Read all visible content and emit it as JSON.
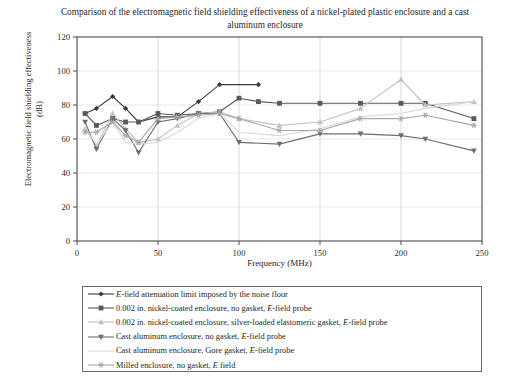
{
  "chart_data": {
    "type": "line",
    "title": "Comparison of the electromagnetic field shielding effectiveness of a nickel-plated plastic enclosure and a cast aluminum enclosure",
    "xlabel": "Frequency (MHz)",
    "ylabel": "Electromagnetic field shielding effectiveness (dB)",
    "xlim": [
      0,
      250
    ],
    "ylim": [
      0,
      120
    ],
    "xticks": [
      0,
      50,
      100,
      150,
      200,
      250
    ],
    "yticks": [
      0,
      20,
      40,
      60,
      80,
      100,
      120
    ],
    "grid": true,
    "legend_position": "below-plot",
    "series": [
      {
        "name": "E-field attenuation limit imposed by the noise floor",
        "marker": "diamond",
        "color": "#3a3a3a",
        "x": [
          5,
          12,
          22,
          30,
          38,
          50,
          62,
          75,
          88,
          112
        ],
        "y": [
          75,
          78,
          85,
          78,
          70,
          73,
          73,
          82,
          92,
          92
        ]
      },
      {
        "name": "0.002 in. nickel-coated enclosure, no gasket, E-field probe",
        "marker": "square",
        "color": "#595959",
        "x": [
          5,
          12,
          22,
          30,
          38,
          50,
          62,
          75,
          88,
          100,
          112,
          125,
          150,
          175,
          200,
          215,
          245
        ],
        "y": [
          75,
          68,
          72,
          70,
          70,
          75,
          74,
          75,
          76,
          84,
          82,
          81,
          81,
          81,
          81,
          81,
          72
        ]
      },
      {
        "name": "0.002 in. nickel-coated enclosure, silver-loaded elastomeric gasket, E-field probe",
        "marker": "triangle-up",
        "color": "#c2c2c2",
        "x": [
          5,
          12,
          22,
          30,
          38,
          50,
          62,
          75,
          88,
          100,
          125,
          150,
          175,
          200,
          215,
          245
        ],
        "y": [
          66,
          56,
          75,
          66,
          58,
          60,
          68,
          75,
          76,
          72,
          68,
          70,
          78,
          95,
          80,
          82
        ]
      },
      {
        "name": "Cast aluminum enclosure, no gasket, E-field probe",
        "marker": "triangle-down",
        "color": "#6e6e6e",
        "x": [
          5,
          12,
          22,
          30,
          38,
          50,
          62,
          75,
          88,
          100,
          125,
          150,
          175,
          200,
          215,
          245
        ],
        "y": [
          70,
          54,
          72,
          65,
          52,
          70,
          72,
          75,
          75,
          58,
          57,
          63,
          63,
          62,
          60,
          53
        ]
      },
      {
        "name": "Cast aluminum enclosure, Gore gasket, E-field probe",
        "marker": "none",
        "color": "#d8d8d8",
        "x": [
          5,
          12,
          22,
          30,
          38,
          50,
          62,
          75,
          88,
          100,
          125,
          150,
          175,
          200,
          215,
          245
        ],
        "y": [
          66,
          57,
          70,
          58,
          57,
          58,
          64,
          72,
          75,
          64,
          62,
          66,
          73,
          75,
          78,
          82
        ]
      },
      {
        "name": "Milled enclosure, no gasket, E field",
        "marker": "star",
        "color": "#a8a8a8",
        "x": [
          5,
          12,
          22,
          30,
          38,
          50,
          62,
          75,
          88,
          100,
          125,
          150,
          175,
          200,
          215,
          245
        ],
        "y": [
          64,
          64,
          70,
          62,
          58,
          72,
          73,
          74,
          75,
          72,
          65,
          65,
          72,
          72,
          74,
          68
        ]
      }
    ]
  },
  "axis": {
    "xticklabels": [
      "0",
      "50",
      "100",
      "150",
      "200",
      "250"
    ],
    "yticklabels": [
      "0",
      "20",
      "40",
      "60",
      "80",
      "100",
      "120"
    ]
  },
  "legend": {
    "items": [
      {
        "label": "E-field attenuation limit imposed by the noise floor",
        "marker": "diamond",
        "color": "#3a3a3a"
      },
      {
        "label": "0.002 in. nickel-coated enclosure, no gasket, E-field probe",
        "marker": "square",
        "color": "#595959"
      },
      {
        "label": "0.002 in. nickel-coated enclosure, silver-loaded elastomeric gasket, E-field probe",
        "marker": "triangle-up",
        "color": "#c2c2c2"
      },
      {
        "label": "Cast aluminum enclosure, no gasket, E-field probe",
        "marker": "triangle-down",
        "color": "#6e6e6e"
      },
      {
        "label": "Cast aluminum enclosure, Gore gasket, E-field probe",
        "marker": "none",
        "color": "#d8d8d8"
      },
      {
        "label": "Milled enclosure, no gasket, E field",
        "marker": "star",
        "color": "#a8a8a8"
      }
    ]
  }
}
